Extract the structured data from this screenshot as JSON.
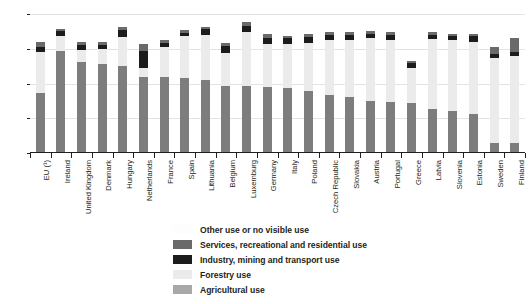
{
  "chart_data": {
    "type": "bar",
    "title": "",
    "subtitle": "",
    "xlabel": "",
    "ylabel": "",
    "ylim": [
      0,
      100
    ],
    "yticks": [
      0,
      25,
      50,
      75,
      100
    ],
    "ytick_labels": [
      "0",
      "25",
      "50",
      "75",
      "100"
    ],
    "grid": true,
    "stacked": true,
    "legend_position": "bottom",
    "categories": [
      "EU (¹)",
      "Ireland",
      "United Kingdom",
      "Denmark",
      "Hungary",
      "Netherlands",
      "France",
      "Spain",
      "Lithuania",
      "Belgium",
      "Luxemburg",
      "Germany",
      "Italy",
      "Poland",
      "Czech Republic",
      "Slovakia",
      "Austria",
      "Portugal",
      "Greece",
      "Latvia",
      "Slovenia",
      "Estonia",
      "Sweden",
      "Finland"
    ],
    "series": [
      {
        "name": "Agricultural use",
        "color": "#7d7d7d",
        "values": [
          43.0,
          73.5,
          65.5,
          64.0,
          62.5,
          55.0,
          54.5,
          54.0,
          52.5,
          48.5,
          48.0,
          47.5,
          46.5,
          44.5,
          42.0,
          40.5,
          37.5,
          36.5,
          36.0,
          31.5,
          30.0,
          28.0,
          7.5,
          7.0
        ]
      },
      {
        "name": "Forestry use",
        "color": "#ebebeb",
        "values": [
          30.0,
          10.5,
          8.5,
          11.0,
          21.0,
          6.0,
          21.5,
          30.0,
          32.5,
          23.5,
          39.0,
          31.0,
          32.0,
          35.0,
          39.5,
          41.0,
          45.0,
          45.0,
          25.5,
          50.5,
          51.0,
          52.0,
          60.5,
          62.5
        ]
      },
      {
        "name": "Industry, mining and transport use",
        "color": "#1c1c1c",
        "values": [
          3.5,
          4.0,
          4.0,
          3.0,
          5.0,
          12.5,
          3.0,
          2.5,
          4.0,
          5.0,
          4.5,
          4.0,
          4.0,
          4.0,
          3.5,
          3.5,
          3.0,
          3.5,
          3.5,
          3.0,
          3.0,
          4.0,
          3.0,
          3.0
        ]
      },
      {
        "name": "Services, recreational and residential use",
        "color": "#6a6a6a",
        "values": [
          3.5,
          1.5,
          2.0,
          2.0,
          2.0,
          5.0,
          2.0,
          2.0,
          1.5,
          2.5,
          3.0,
          3.0,
          2.0,
          2.0,
          2.0,
          2.0,
          2.0,
          2.0,
          1.5,
          2.0,
          2.0,
          2.0,
          5.0,
          10.5
        ]
      }
    ],
    "legend_entries": [
      {
        "label": "Other use or no visible use",
        "color": "#fdfdfd"
      },
      {
        "label": "Services, recreational and residential use",
        "color": "#6a6a6a"
      },
      {
        "label": "Industry, mining and transport use",
        "color": "#1c1c1c"
      },
      {
        "label": "Forestry use",
        "color": "#ebebeb"
      },
      {
        "label": "Agricultural use",
        "color": "#a8a8a8"
      }
    ]
  }
}
